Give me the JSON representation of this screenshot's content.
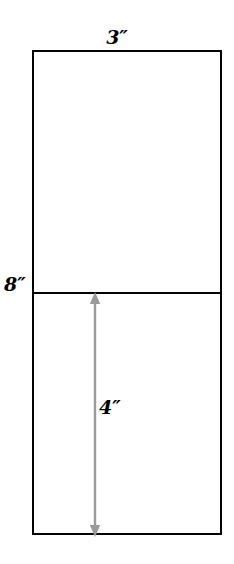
{
  "diagram": {
    "background_color": "#ffffff",
    "stroke_color": "#000000",
    "arrow_color": "#9a9a9a",
    "shape": {
      "name": "rectangle",
      "width_label": "3″",
      "height_label": "8″",
      "segment_label": "4″"
    },
    "labels": {
      "width": "3″",
      "total_height": "8″",
      "lower_segment": "4″"
    },
    "regions": {
      "upper": "upper-half",
      "lower": "lower-half"
    },
    "arrow": {
      "name": "double-headed-vertical-arrow",
      "orientation": "vertical",
      "heads": "both",
      "measures": "4″"
    }
  }
}
